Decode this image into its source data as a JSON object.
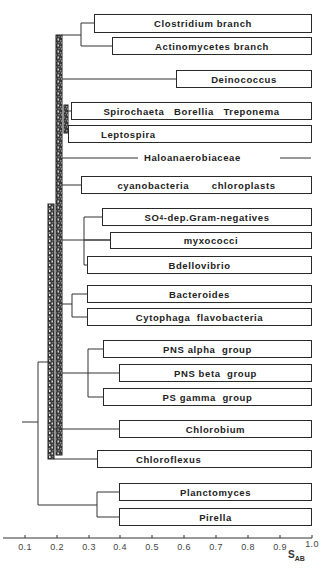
{
  "figure": {
    "type": "dendrogram",
    "axis": {
      "title": "S",
      "title_subscript": "AB",
      "ticks": [
        "0.1",
        "0.2",
        "0.3",
        "0.4",
        "0.5",
        "0.6",
        "0.7",
        "0.8",
        "0.9",
        "1.0"
      ],
      "range": [
        0.0,
        1.0
      ]
    },
    "taxa": [
      {
        "id": "clostridium",
        "label": "Clostridium branch",
        "node_s": 0.28
      },
      {
        "id": "actinomycetes",
        "label": "Actinomycetes branch",
        "node_s": 0.34
      },
      {
        "id": "deinococcus",
        "label": "Deinococcus",
        "node_s": 0.57
      },
      {
        "id": "spirochaeta",
        "label": "Spirochaeta   Borellia   Treponema",
        "node_s": 0.24
      },
      {
        "id": "leptospira",
        "label": "Leptospira",
        "node_s": 0.23
      },
      {
        "id": "haloanaerobiaceae",
        "label": "Haloanaerobiaceae",
        "node_s": 1.0
      },
      {
        "id": "cyanobacteria",
        "label": "cyanobacteria       chloroplasts",
        "node_s": 0.28
      },
      {
        "id": "so4",
        "label_main": "SO",
        "label_sub": "4",
        "label_rest": "-dep.Gram-negatives",
        "label": "SO4-dep.Gram-negatives",
        "node_s": 0.34
      },
      {
        "id": "myxococci",
        "label": "myxococci",
        "node_s": 0.37
      },
      {
        "id": "bdellovibrio",
        "label": "Bdellovibrio",
        "node_s": 0.29
      },
      {
        "id": "bacteroides",
        "label": "Bacteroides",
        "node_s": 0.29
      },
      {
        "id": "cytophaga",
        "label": "Cytophaga  flavobacteria",
        "node_s": 0.29
      },
      {
        "id": "pns_alpha",
        "label": "PNS alpha  group",
        "node_s": 0.34
      },
      {
        "id": "pns_beta",
        "label": "PNS beta  group",
        "node_s": 0.39
      },
      {
        "id": "ps_gamma",
        "label": "PS gamma  group",
        "node_s": 0.34
      },
      {
        "id": "chlorobium",
        "label": "Chlorobium",
        "node_s": 0.39
      },
      {
        "id": "chloroflexus",
        "label": "Chloroflexus",
        "node_s": 0.33
      },
      {
        "id": "planctomyces",
        "label": "Planctomyces",
        "node_s": 0.39
      },
      {
        "id": "pirella",
        "label": "Pirella",
        "node_s": 0.39
      }
    ]
  }
}
